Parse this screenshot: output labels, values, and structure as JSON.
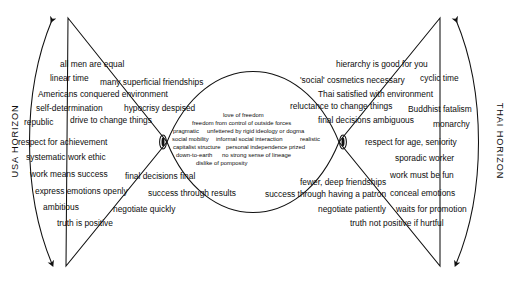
{
  "diagram": {
    "title_left": "USA HORIZON",
    "title_right": "THAI HORIZON",
    "left_dash": "—",
    "right_dash": "—"
  },
  "usa_items": [
    {
      "text": "all men are equal",
      "x": 60,
      "y": 60,
      "size": "big"
    },
    {
      "text": "linear time",
      "x": 50,
      "y": 74,
      "size": "big"
    },
    {
      "text": "many superficial friendships",
      "x": 100,
      "y": 78,
      "size": "big"
    },
    {
      "text": "Americans conquered environment",
      "x": 38,
      "y": 90,
      "size": "big"
    },
    {
      "text": "self-determination",
      "x": 36,
      "y": 104,
      "size": "big"
    },
    {
      "text": "hypocrisy despised",
      "x": 124,
      "y": 104,
      "size": "big"
    },
    {
      "text": "republic",
      "x": 24,
      "y": 118,
      "size": "big"
    },
    {
      "text": "drive to change things",
      "x": 70,
      "y": 116,
      "size": "big"
    },
    {
      "text": "respect for achievement",
      "x": 18,
      "y": 138,
      "size": "big"
    },
    {
      "text": "systematic work ethic",
      "x": 26,
      "y": 153,
      "size": "big"
    },
    {
      "text": "work means success",
      "x": 30,
      "y": 170,
      "size": "big"
    },
    {
      "text": "final decisions final",
      "x": 125,
      "y": 172,
      "size": "big"
    },
    {
      "text": "express emotions openly",
      "x": 35,
      "y": 187,
      "size": "big"
    },
    {
      "text": "success through results",
      "x": 148,
      "y": 189,
      "size": "big"
    },
    {
      "text": "ambitious",
      "x": 43,
      "y": 203,
      "size": "big"
    },
    {
      "text": "negotiate quickly",
      "x": 113,
      "y": 205,
      "size": "big"
    },
    {
      "text": "truth is positive",
      "x": 57,
      "y": 219,
      "size": "big"
    }
  ],
  "thai_items": [
    {
      "text": "hierarchy is good for you",
      "x": 336,
      "y": 60,
      "size": "big"
    },
    {
      "text": "'social' cosmetics necessary",
      "x": 300,
      "y": 76,
      "size": "big"
    },
    {
      "text": "cyclic time",
      "x": 420,
      "y": 74,
      "size": "big"
    },
    {
      "text": "Thai satisfied with environment",
      "x": 318,
      "y": 90,
      "size": "big"
    },
    {
      "text": "reluctance to change things",
      "x": 290,
      "y": 102,
      "size": "big"
    },
    {
      "text": "Buddhist fatalism",
      "x": 408,
      "y": 105,
      "size": "big"
    },
    {
      "text": "final decisions ambiguous",
      "x": 318,
      "y": 116,
      "size": "big"
    },
    {
      "text": "monarchy",
      "x": 433,
      "y": 120,
      "size": "big"
    },
    {
      "text": "respect for age, seniority",
      "x": 365,
      "y": 138,
      "size": "big"
    },
    {
      "text": "sporadic worker",
      "x": 395,
      "y": 154,
      "size": "big"
    },
    {
      "text": "work must be fun",
      "x": 390,
      "y": 171,
      "size": "big"
    },
    {
      "text": "fewer, deep friendships",
      "x": 300,
      "y": 178,
      "size": "big"
    },
    {
      "text": "success through having a patron",
      "x": 265,
      "y": 190,
      "size": "big"
    },
    {
      "text": "conceal emotions",
      "x": 390,
      "y": 189,
      "size": "big"
    },
    {
      "text": "negotiate patiently",
      "x": 318,
      "y": 205,
      "size": "big"
    },
    {
      "text": "waits for promotion",
      "x": 396,
      "y": 205,
      "size": "big"
    },
    {
      "text": "truth not positive if hurtful",
      "x": 350,
      "y": 219,
      "size": "big"
    }
  ],
  "shared_items": [
    {
      "text": "love of freedom",
      "x": 223,
      "y": 113,
      "size": "small"
    },
    {
      "text": "freedom from control of outside forces",
      "x": 192,
      "y": 121,
      "size": "small"
    },
    {
      "text": "pragmatic",
      "x": 173,
      "y": 129,
      "size": "small"
    },
    {
      "text": "unfettered by rigid ideology or dogma",
      "x": 207,
      "y": 129,
      "size": "small"
    },
    {
      "text": "social mobility",
      "x": 172,
      "y": 137,
      "size": "small"
    },
    {
      "text": "informal social interaction",
      "x": 216,
      "y": 137,
      "size": "small"
    },
    {
      "text": "realistic",
      "x": 300,
      "y": 137,
      "size": "small"
    },
    {
      "text": "capitalist structure",
      "x": 173,
      "y": 145,
      "size": "small"
    },
    {
      "text": "personal independence prized",
      "x": 226,
      "y": 145,
      "size": "small"
    },
    {
      "text": "down-to-earth",
      "x": 176,
      "y": 153,
      "size": "small"
    },
    {
      "text": "no strong sense of lineage",
      "x": 222,
      "y": 153,
      "size": "small"
    },
    {
      "text": "dislike of pomposity",
      "x": 196,
      "y": 161,
      "size": "small"
    }
  ]
}
